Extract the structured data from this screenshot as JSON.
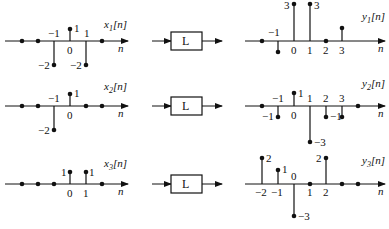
{
  "rows": [
    {
      "input": {
        "name": "x",
        "sub": "1",
        "axis_label": "n",
        "points": [
          {
            "n": -3,
            "v": 0
          },
          {
            "n": -2,
            "v": 0
          },
          {
            "n": -1,
            "v": -2
          },
          {
            "n": 0,
            "v": 1
          },
          {
            "n": 1,
            "v": -2
          },
          {
            "n": 2,
            "v": 0
          }
        ],
        "labels": [
          {
            "text": "−1",
            "kind": "tick",
            "n": -1
          },
          {
            "text": "0",
            "kind": "tick",
            "n": 0
          },
          {
            "text": "1",
            "kind": "tick",
            "n": 1
          },
          {
            "text": "1",
            "kind": "value",
            "n": 0
          },
          {
            "text": "−2",
            "kind": "value",
            "n": -1
          },
          {
            "text": "−2",
            "kind": "value",
            "n": 1
          }
        ]
      },
      "system": "L",
      "output": {
        "name": "y",
        "sub": "1",
        "axis_label": "n",
        "points": [
          {
            "n": -2,
            "v": 0
          },
          {
            "n": -1,
            "v": -1
          },
          {
            "n": 0,
            "v": 3
          },
          {
            "n": 1,
            "v": 3
          },
          {
            "n": 2,
            "v": 0
          },
          {
            "n": 3,
            "v": 1
          }
        ],
        "labels": [
          {
            "text": "−1",
            "kind": "tick",
            "n": -1
          },
          {
            "text": "0",
            "kind": "tick",
            "n": 0
          },
          {
            "text": "1",
            "kind": "tick",
            "n": 1
          },
          {
            "text": "2",
            "kind": "tick",
            "n": 2
          },
          {
            "text": "3",
            "kind": "tick",
            "n": 3
          },
          {
            "text": "3",
            "kind": "value",
            "n": 0
          },
          {
            "text": "3",
            "kind": "value",
            "n": 1
          }
        ]
      }
    },
    {
      "input": {
        "name": "x",
        "sub": "2",
        "axis_label": "n",
        "points": [
          {
            "n": -3,
            "v": 0
          },
          {
            "n": -2,
            "v": 0
          },
          {
            "n": -1,
            "v": -2
          },
          {
            "n": 0,
            "v": 1
          },
          {
            "n": 1,
            "v": 0
          },
          {
            "n": 2,
            "v": 0
          }
        ],
        "labels": [
          {
            "text": "−1",
            "kind": "tick",
            "n": -1
          },
          {
            "text": "0",
            "kind": "tick",
            "n": 0
          },
          {
            "text": "1",
            "kind": "value",
            "n": 0
          },
          {
            "text": "−2",
            "kind": "value",
            "n": -1
          }
        ]
      },
      "system": "L",
      "output": {
        "name": "y",
        "sub": "2",
        "axis_label": "n",
        "points": [
          {
            "n": -2,
            "v": 0
          },
          {
            "n": -1,
            "v": -1
          },
          {
            "n": 0,
            "v": 1
          },
          {
            "n": 1,
            "v": -3
          },
          {
            "n": 2,
            "v": -1
          },
          {
            "n": 3,
            "v": -1
          },
          {
            "n": 4,
            "v": 0
          }
        ],
        "labels": [
          {
            "text": "−1",
            "kind": "tick",
            "n": -1
          },
          {
            "text": "0",
            "kind": "tick",
            "n": 0
          },
          {
            "text": "1",
            "kind": "tick",
            "n": 1
          },
          {
            "text": "2",
            "kind": "tick",
            "n": 2
          },
          {
            "text": "3",
            "kind": "tick",
            "n": 3
          },
          {
            "text": "1",
            "kind": "value",
            "n": 0
          },
          {
            "text": "−1",
            "kind": "value",
            "n": -1
          },
          {
            "text": "−1",
            "kind": "value",
            "n": 2
          },
          {
            "text": "−3",
            "kind": "value",
            "n": 1
          }
        ]
      }
    },
    {
      "input": {
        "name": "x",
        "sub": "3",
        "axis_label": "n",
        "points": [
          {
            "n": -3,
            "v": 0
          },
          {
            "n": -2,
            "v": 0
          },
          {
            "n": -1,
            "v": 0
          },
          {
            "n": 0,
            "v": 1
          },
          {
            "n": 1,
            "v": 1
          },
          {
            "n": 2,
            "v": 0
          }
        ],
        "labels": [
          {
            "text": "0",
            "kind": "tick",
            "n": 0
          },
          {
            "text": "1",
            "kind": "tick",
            "n": 1
          },
          {
            "text": "1",
            "kind": "value",
            "n": 0
          },
          {
            "text": "1",
            "kind": "value",
            "n": 1
          }
        ]
      },
      "system": "L",
      "output": {
        "name": "y",
        "sub": "3",
        "axis_label": "n",
        "points": [
          {
            "n": -2,
            "v": 2
          },
          {
            "n": -1,
            "v": 1
          },
          {
            "n": 0,
            "v": -3
          },
          {
            "n": 1,
            "v": 0
          },
          {
            "n": 2,
            "v": 2
          },
          {
            "n": 3,
            "v": 0
          },
          {
            "n": 4,
            "v": 0
          }
        ],
        "labels": [
          {
            "text": "−2",
            "kind": "tick",
            "n": -2
          },
          {
            "text": "−1",
            "kind": "tick",
            "n": -1
          },
          {
            "text": "0",
            "kind": "tick",
            "n": 0
          },
          {
            "text": "1",
            "kind": "tick",
            "n": 1
          },
          {
            "text": "2",
            "kind": "tick",
            "n": 2
          },
          {
            "text": "2",
            "kind": "value",
            "n": -2
          },
          {
            "text": "1",
            "kind": "value",
            "n": -1
          },
          {
            "text": "2",
            "kind": "value",
            "n": 2
          },
          {
            "text": "−3",
            "kind": "value",
            "n": 0
          }
        ]
      }
    }
  ]
}
